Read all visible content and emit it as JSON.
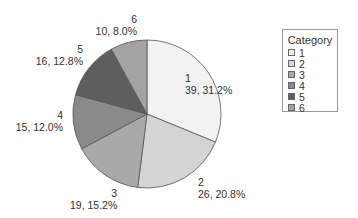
{
  "chart_data": {
    "type": "pie",
    "title": "",
    "legend_title": "Category",
    "legend_position": "right",
    "start_angle_deg": 90,
    "direction": "clockwise",
    "categories": [
      "1",
      "2",
      "3",
      "4",
      "5",
      "6"
    ],
    "values": [
      39,
      26,
      19,
      15,
      16,
      10
    ],
    "percentages": [
      31.2,
      20.8,
      15.2,
      12.0,
      12.8,
      8.0
    ],
    "labels": [
      "39, 31.2%",
      "26, 20.8%",
      "19, 15.2%",
      "15, 12.0%",
      "16, 12.8%",
      "10, 8.0%"
    ],
    "colors": [
      "#f2f2f2",
      "#d4d4d4",
      "#a9a9a9",
      "#8a8a8a",
      "#5e5e5e",
      "#a3a3a3"
    ]
  },
  "legend": {
    "title": "Category",
    "items": [
      {
        "label": "1",
        "color": "#f2f2f2"
      },
      {
        "label": "2",
        "color": "#d4d4d4"
      },
      {
        "label": "3",
        "color": "#a9a9a9"
      },
      {
        "label": "4",
        "color": "#8a8a8a"
      },
      {
        "label": "5",
        "color": "#5e5e5e"
      },
      {
        "label": "6",
        "color": "#a3a3a3"
      }
    ]
  },
  "slice_labels": [
    {
      "cat": "1",
      "text": "39, 31.2%"
    },
    {
      "cat": "2",
      "text": "26, 20.8%"
    },
    {
      "cat": "3",
      "text": "19, 15.2%"
    },
    {
      "cat": "4",
      "text": "15, 12.0%"
    },
    {
      "cat": "5",
      "text": "16, 12.8%"
    },
    {
      "cat": "6",
      "text": "10, 8.0%"
    }
  ]
}
